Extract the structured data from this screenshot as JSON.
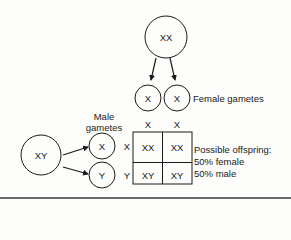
{
  "diagram": {
    "type": "punnett-square",
    "female_parent": {
      "genotype": "XX"
    },
    "male_parent": {
      "genotype": "XY"
    },
    "female_gametes": {
      "label": "Female gametes",
      "items": [
        "X",
        "X"
      ]
    },
    "male_gametes": {
      "label_line1": "Male",
      "label_line2": "gametes",
      "items": [
        "X",
        "Y"
      ]
    },
    "grid": {
      "column_headers": [
        "X",
        "X"
      ],
      "row_headers": [
        "X",
        "Y"
      ],
      "cells": [
        [
          "XX",
          "XX"
        ],
        [
          "XY",
          "XY"
        ]
      ]
    },
    "result": {
      "line1": "Possible offspring:",
      "line2": "50% female",
      "line3": "50% male"
    },
    "colors": {
      "stroke": "#1a1a1a",
      "background": "#fdfdfb",
      "rule": "#6a6a6a"
    }
  }
}
